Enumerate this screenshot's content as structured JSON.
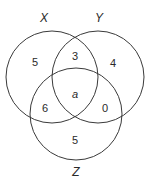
{
  "diagram": {
    "type": "venn",
    "sets": [
      {
        "label": "X",
        "cx": 52,
        "cy": 77,
        "r": 46,
        "label_x": 44,
        "label_y": 22
      },
      {
        "label": "Y",
        "cx": 98,
        "cy": 77,
        "r": 46,
        "label_x": 99,
        "label_y": 22
      },
      {
        "label": "Z",
        "cx": 76,
        "cy": 114,
        "r": 46,
        "label_x": 76,
        "label_y": 176
      }
    ],
    "regions": {
      "x_only": "5",
      "x_and_y_only": "3",
      "y_only": "4",
      "x_y_z": "a",
      "x_and_z_only": "6",
      "y_and_z_only": "0",
      "z_only": "5"
    },
    "stroke_color": "#3a3a3a",
    "text_color": "#2a2a2a"
  }
}
